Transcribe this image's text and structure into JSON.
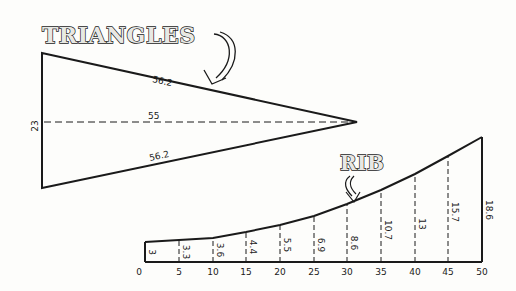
{
  "triangles": {
    "title": "TRIANGLES",
    "side_top": "56.2",
    "side_bottom": "56.2",
    "center_line": "55",
    "base": "23"
  },
  "rib": {
    "title": "RIB",
    "x_ticks": [
      "0",
      "5",
      "10",
      "15",
      "20",
      "25",
      "30",
      "35",
      "40",
      "45",
      "50"
    ],
    "heights": [
      "3",
      "3.3",
      "3.6",
      "4.4",
      "5.5",
      "6.9",
      "8.6",
      "10.7",
      "13",
      "15.7",
      "18.6"
    ]
  },
  "colors": {
    "ink": "#1a1a1a",
    "paper": "#fdfdfb"
  }
}
